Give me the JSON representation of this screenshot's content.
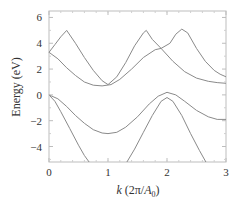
{
  "chart_data": {
    "type": "line",
    "title": "",
    "xlabel": "k (2π/A0)",
    "xlabel_parts": {
      "var": "k",
      "rest_open": " (2π/",
      "A": "A",
      "sub": "0",
      "close": ")"
    },
    "ylabel": "Energy (eV)",
    "xlim": [
      0,
      3
    ],
    "ylim": [
      -5.2,
      6.5
    ],
    "xticks": [
      0,
      1,
      2,
      3
    ],
    "yticks": [
      -4,
      -2,
      0,
      2,
      4,
      6
    ],
    "grid": false,
    "legend": null,
    "line_color": "#8a8a8a",
    "series": [
      {
        "name": "band-upper-a",
        "x": [
          0,
          0.1,
          0.2,
          0.3,
          0.45,
          0.6,
          0.75,
          0.9,
          1.0,
          1.15,
          1.3,
          1.45,
          1.6,
          1.65,
          1.75,
          1.9,
          2.1,
          2.3,
          2.5,
          2.7,
          2.85,
          3.0
        ],
        "y": [
          3.3,
          3.9,
          4.5,
          5.0,
          4.0,
          2.9,
          1.9,
          1.1,
          0.8,
          1.4,
          2.5,
          3.8,
          4.8,
          5.0,
          4.3,
          3.6,
          2.6,
          1.8,
          1.3,
          1.05,
          0.95,
          0.9
        ]
      },
      {
        "name": "band-upper-b",
        "x": [
          0,
          0.15,
          0.3,
          0.45,
          0.6,
          0.75,
          0.9,
          1.05,
          1.2,
          1.4,
          1.6,
          1.8,
          1.9,
          2.05,
          2.15,
          2.25,
          2.35,
          2.5,
          2.65,
          2.8,
          2.9,
          3.0
        ],
        "y": [
          3.3,
          2.8,
          2.1,
          1.5,
          1.0,
          0.75,
          0.7,
          0.8,
          1.2,
          2.0,
          2.9,
          3.5,
          3.6,
          4.0,
          4.7,
          5.1,
          4.8,
          3.6,
          2.6,
          1.9,
          1.6,
          1.4
        ]
      },
      {
        "name": "band-lower-c",
        "x": [
          0,
          0.15,
          0.3,
          0.45,
          0.6,
          0.75,
          0.9,
          1.0,
          1.15,
          1.3,
          1.5,
          1.7,
          1.85,
          2.0,
          2.15,
          2.3,
          2.5,
          2.7,
          2.85,
          3.0
        ],
        "y": [
          0,
          -0.3,
          -0.9,
          -1.6,
          -2.2,
          -2.7,
          -2.95,
          -3.0,
          -2.9,
          -2.5,
          -1.7,
          -0.7,
          -0.1,
          0.2,
          0.0,
          -0.5,
          -1.2,
          -1.7,
          -1.9,
          -1.9
        ]
      },
      {
        "name": "band-lower-d-left",
        "x": [
          0,
          0.1,
          0.2,
          0.35,
          0.5,
          0.6,
          0.68
        ],
        "y": [
          0,
          -0.5,
          -1.3,
          -2.6,
          -3.9,
          -4.7,
          -5.2
        ]
      },
      {
        "name": "band-lower-d-right",
        "x": [
          1.32,
          1.45,
          1.6,
          1.75,
          1.9,
          2.0,
          2.1,
          2.25,
          2.4,
          2.55,
          2.66
        ],
        "y": [
          -5.2,
          -4.2,
          -2.9,
          -1.6,
          -0.5,
          -0.2,
          -0.5,
          -1.6,
          -3.0,
          -4.3,
          -5.2
        ]
      }
    ]
  }
}
